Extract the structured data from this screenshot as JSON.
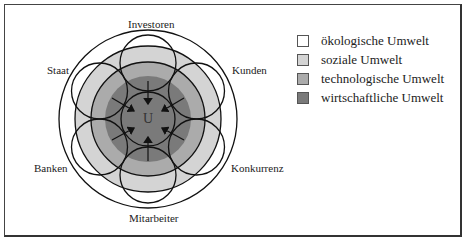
{
  "diagram": {
    "center_label": "U",
    "stakeholders": [
      {
        "name": "Investoren",
        "position": "top"
      },
      {
        "name": "Kunden",
        "position": "upper-right"
      },
      {
        "name": "Konkurrenz",
        "position": "lower-right"
      },
      {
        "name": "Mitarbeiter",
        "position": "bottom"
      },
      {
        "name": "Banken",
        "position": "lower-left"
      },
      {
        "name": "Staat",
        "position": "upper-left"
      }
    ],
    "rings": [
      {
        "name": "ökologische Umwelt",
        "color": "#ffffff"
      },
      {
        "name": "soziale Umwelt",
        "color": "#d4d4d4"
      },
      {
        "name": "technologische Umwelt",
        "color": "#ababab"
      },
      {
        "name": "wirtschaftliche Umwelt",
        "color": "#7a7a7a"
      }
    ]
  },
  "legend": {
    "items": [
      {
        "label": "ökologische Umwelt",
        "color": "#ffffff"
      },
      {
        "label": "soziale Umwelt",
        "color": "#d4d4d4"
      },
      {
        "label": "technologische Umwelt",
        "color": "#ababab"
      },
      {
        "label": "wirtschaftliche Umwelt",
        "color": "#7a7a7a"
      }
    ]
  }
}
